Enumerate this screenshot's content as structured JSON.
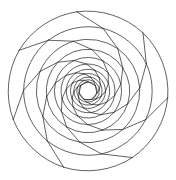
{
  "figure": {
    "type": "geometric-line-figure",
    "background_color": "#ffffff",
    "stroke_color": "#3a3a3a",
    "stroke_width": 0.8,
    "fill": "none",
    "canvas": {
      "width": 176,
      "height": 180
    },
    "center": {
      "x": 88,
      "y": 91
    },
    "outer_radius": 80,
    "symmetry_order": 7,
    "iterations": 12,
    "scale_per_iteration": 0.805,
    "rotation_per_iteration_deg": 21.5,
    "initial_rotation_deg": -98,
    "min_radius": 7.5,
    "elements": {
      "polygon_edges": "straight chords joining consecutive vertices of each nested heptagon",
      "arcs": "circular arcs bulging outward connecting each vertex to the next vertex of the same ring",
      "radial_spokes": "straight segments linking each ring vertex to the corresponding vertex of the next inner ring"
    }
  },
  "chart_data": {
    "type": "line",
    "xlabel": "",
    "ylabel": "",
    "x": [],
    "values": [],
    "categories": [],
    "series": [
      {
        "name": "ring-0",
        "radius": 80.0,
        "rotation_deg": -98.0
      },
      {
        "name": "ring-1",
        "radius": 64.4,
        "rotation_deg": -76.5
      },
      {
        "name": "ring-2",
        "radius": 51.8,
        "rotation_deg": -55.0
      },
      {
        "name": "ring-3",
        "radius": 41.7,
        "rotation_deg": -33.5
      },
      {
        "name": "ring-4",
        "radius": 33.6,
        "rotation_deg": -12.0
      },
      {
        "name": "ring-5",
        "radius": 27.0,
        "rotation_deg": 9.5
      },
      {
        "name": "ring-6",
        "radius": 21.8,
        "rotation_deg": 31.0
      },
      {
        "name": "ring-7",
        "radius": 17.5,
        "rotation_deg": 52.5
      },
      {
        "name": "ring-8",
        "radius": 14.1,
        "rotation_deg": 74.0
      },
      {
        "name": "ring-9",
        "radius": 11.4,
        "rotation_deg": 95.5
      },
      {
        "name": "ring-10",
        "radius": 9.2,
        "rotation_deg": 117.0
      },
      {
        "name": "ring-11",
        "radius": 7.4,
        "rotation_deg": 138.5
      }
    ],
    "axis": {
      "grid": false,
      "legend": "none",
      "xlim": [
        0,
        176
      ],
      "ylim": [
        0,
        180
      ]
    }
  }
}
